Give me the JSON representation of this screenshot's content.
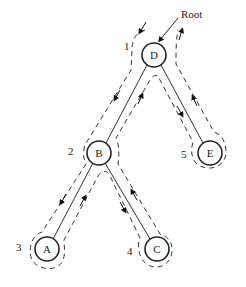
{
  "diagram": {
    "type": "binary-tree-traversal",
    "root_label": "Root",
    "nodes": [
      {
        "id": "D",
        "label": "D",
        "order": "1"
      },
      {
        "id": "B",
        "label": "B",
        "order": "2"
      },
      {
        "id": "A",
        "label": "A",
        "order": "3"
      },
      {
        "id": "C",
        "label": "C",
        "order": "4"
      },
      {
        "id": "E",
        "label": "E",
        "order": "5"
      }
    ],
    "edges": [
      [
        "D",
        "B"
      ],
      [
        "D",
        "E"
      ],
      [
        "B",
        "A"
      ],
      [
        "B",
        "C"
      ]
    ]
  }
}
